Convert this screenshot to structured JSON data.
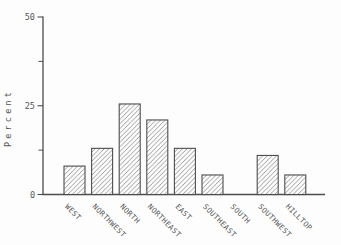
{
  "chart_data": {
    "type": "bar",
    "title": "",
    "xlabel": "",
    "ylabel": "Percent",
    "categories": [
      "WEST",
      "NORTHWEST",
      "NORTH",
      "NORTHEAST",
      "EAST",
      "SOUTHEAST",
      "SOUTH",
      "SOUTHWEST",
      "HILLTOP"
    ],
    "values": [
      8,
      13,
      25.5,
      21,
      13,
      5.5,
      0,
      11,
      5.5
    ],
    "ylim": [
      0,
      50
    ],
    "yticks_labeled": [
      0,
      25,
      50
    ],
    "ytick_labels": [
      "0",
      "25",
      "50"
    ],
    "yticks_minor": [
      12.5,
      37.5
    ],
    "grid": false,
    "legend": null,
    "bar_style": {
      "hatch": "diagonal-forward",
      "hatch_color": "#8f8f8f",
      "outline_color": "#4d4d4d",
      "fill": "#fdfdfd"
    },
    "axis_color": "#4d4d4d",
    "text_color": "#565656",
    "background": "#fdfdfd"
  }
}
